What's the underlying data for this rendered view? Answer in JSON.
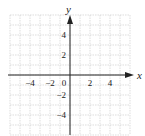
{
  "chart_data": {
    "type": "scatter",
    "title": "",
    "xlabel": "x",
    "ylabel": "y",
    "xlim": [
      -6,
      6
    ],
    "ylim": [
      -6,
      6
    ],
    "grid": true,
    "grid_step": 1,
    "x_ticks": [
      -4,
      -2,
      0,
      2,
      4
    ],
    "y_ticks": [
      4,
      2,
      -2,
      -4
    ],
    "x_tick_labels": [
      "−4",
      "−2",
      "0",
      "2",
      "4"
    ],
    "y_tick_labels": [
      "4",
      "2",
      "−2",
      "−4"
    ],
    "series": []
  },
  "labels": {
    "x_axis": "x",
    "y_axis": "y",
    "origin": "0",
    "x_neg4": "−4",
    "x_neg2": "−2",
    "x_2": "2",
    "x_4": "4",
    "y_4": "4",
    "y_2": "2",
    "y_neg2": "−2",
    "y_neg4": "−4"
  },
  "colors": {
    "grid": "#c8c8c8",
    "axis": "#222222"
  }
}
